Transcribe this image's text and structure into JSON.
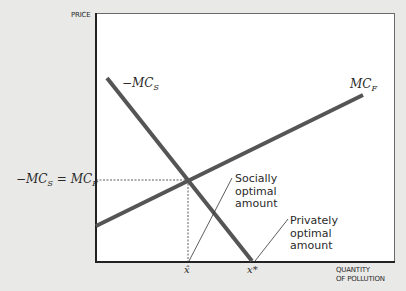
{
  "figure": {
    "y_axis_label": "PRICE",
    "x_axis_label_line1": "QUANTITY",
    "x_axis_label_line2": "OF POLLUTION",
    "curves": {
      "neg_mcs_label_prefix": "−MC",
      "neg_mcs_label_sub": "S",
      "mcf_label_prefix": "MC",
      "mcf_label_sub": "F"
    },
    "equilibrium_label_left": "−MC",
    "equilibrium_label_left_sub": "S",
    "equilibrium_label_eq": " = MC",
    "equilibrium_label_right_sub": "F",
    "x_ticks": {
      "x_hat": "x̂",
      "x_star": "x*"
    },
    "annotations": {
      "socially_line1": "Socially",
      "socially_line2": "optimal",
      "socially_line3": "amount",
      "privately_line1": "Privately",
      "privately_line2": "optimal",
      "privately_line3": "amount"
    },
    "colors": {
      "curve": "#555555",
      "axis": "#222222",
      "background": "#e9e9e7",
      "plot_bg": "#ffffff"
    }
  }
}
